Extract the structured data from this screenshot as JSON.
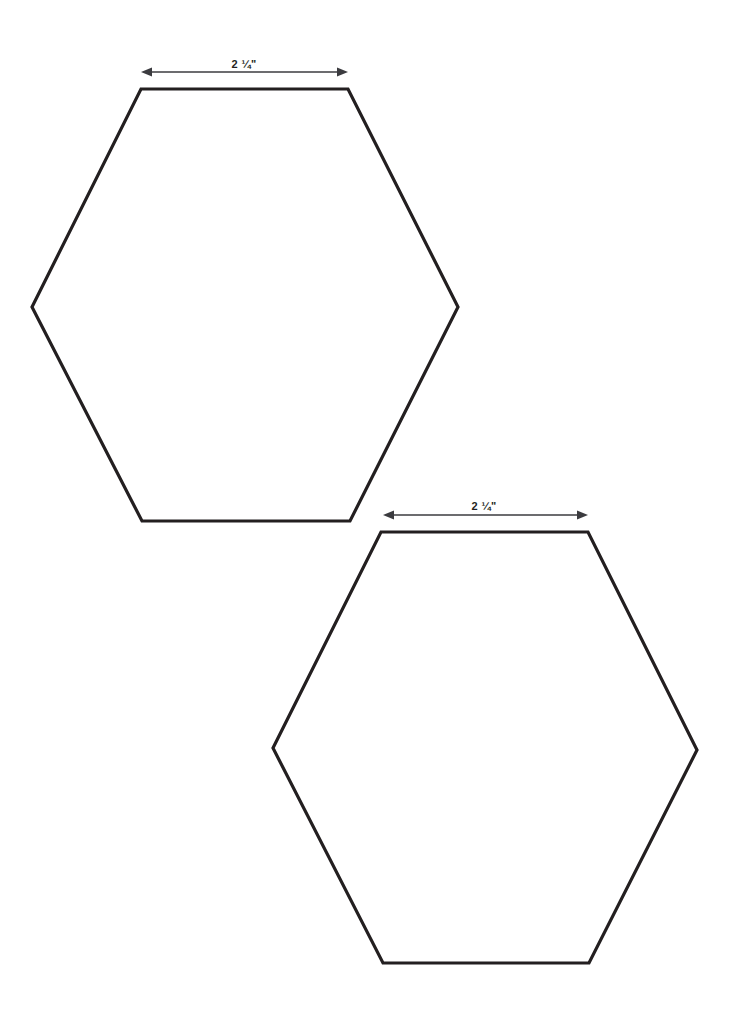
{
  "page": {
    "background_color": "#ffffff",
    "width": 743,
    "height": 1028
  },
  "style": {
    "shape_stroke_color": "#231f20",
    "shape_fill_color": "#ffffff",
    "shape_stroke_width": 3.2,
    "dimension_line_color": "#3b3b3f",
    "dimension_line_width": 1.7,
    "label_color": "#231f20"
  },
  "shapes": [
    {
      "name": "hexagon-1",
      "type": "hexagon",
      "orientation": "flat-top",
      "points": "141,89 348,89 458,307 350,521 142,521 32,307",
      "dimension": {
        "label": "2 ¼\"",
        "label_x": 244,
        "label_y": 59,
        "line_y": 72,
        "x_start": 141,
        "x_end": 348,
        "arrowheads": "both"
      }
    },
    {
      "name": "hexagon-2",
      "type": "hexagon",
      "orientation": "flat-top",
      "points": "381,532 588,532 697,750 589,963 383,963 273,748",
      "dimension": {
        "label": "2 ¼\"",
        "label_x": 484,
        "label_y": 501,
        "line_y": 515,
        "x_start": 383,
        "x_end": 588,
        "arrowheads": "both"
      }
    }
  ]
}
